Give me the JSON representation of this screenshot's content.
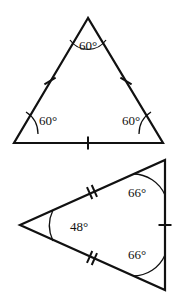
{
  "figure": {
    "stroke_color": "#111111",
    "background_color": "#ffffff",
    "degree_symbol": "°",
    "shapes": [
      {
        "id": "equilateral-triangle",
        "name": "top-triangle",
        "vertices": [
          {
            "id": "apex",
            "x": 88,
            "y": 18
          },
          {
            "id": "bottom-left",
            "x": 14,
            "y": 143
          },
          {
            "id": "bottom-right",
            "x": 163,
            "y": 143
          }
        ],
        "angles": [
          {
            "id": "apex-angle",
            "label": "60°",
            "value": 60,
            "label_x": 88,
            "label_y": 47,
            "arc_d": "M 70 40 A 22 22 0 0 0 106 40"
          },
          {
            "id": "bottom-left-angle",
            "label": "60°",
            "value": 60,
            "label_x": 48,
            "label_y": 122,
            "arc_d": "M 38 134 A 26 26 0 0 0 26 112"
          },
          {
            "id": "bottom-right-angle",
            "label": "60°",
            "value": 60,
            "label_x": 131,
            "label_y": 122,
            "arc_d": "M 151 112 A 26 26 0 0 0 139 134"
          }
        ],
        "ticks": [
          {
            "id": "left-side-tick",
            "count": 1,
            "cx": 50,
            "cy": 81,
            "angle_deg": 59.4
          },
          {
            "id": "right-side-tick",
            "count": 1,
            "cx": 126,
            "cy": 81,
            "angle_deg": -59.4
          },
          {
            "id": "base-tick",
            "count": 1,
            "cx": 88,
            "cy": 143,
            "angle_deg": 0
          }
        ]
      },
      {
        "id": "isosceles-triangle",
        "name": "bottom-triangle",
        "vertices": [
          {
            "id": "left-apex",
            "x": 20,
            "y": 225
          },
          {
            "id": "top-right",
            "x": 165,
            "y": 160
          },
          {
            "id": "bottom-right",
            "x": 165,
            "y": 290
          }
        ],
        "angles": [
          {
            "id": "left-apex-angle",
            "label": "48°",
            "value": 48,
            "label_x": 79,
            "label_y": 228,
            "arc_d": "M 53 210 A 36 36 0 0 0 53 241"
          },
          {
            "id": "top-right-angle",
            "label": "66°",
            "value": 66,
            "label_x": 137,
            "label_y": 194,
            "arc_d": "M 133 174 A 35 35 0 0 1 165 195"
          },
          {
            "id": "bottom-right-angle",
            "label": "66°",
            "value": 66,
            "label_x": 137,
            "label_y": 256,
            "arc_d": "M 165 255 A 35 35 0 0 1 133 276"
          }
        ],
        "ticks": [
          {
            "id": "upper-left-side-tick",
            "count": 2,
            "cx": 92,
            "cy": 192,
            "angle_deg": -24.1
          },
          {
            "id": "lower-left-side-tick",
            "count": 2,
            "cx": 92,
            "cy": 258,
            "angle_deg": 24.1
          },
          {
            "id": "right-side-tick",
            "count": 1,
            "cx": 165,
            "cy": 225,
            "angle_deg": 90
          }
        ]
      }
    ]
  }
}
